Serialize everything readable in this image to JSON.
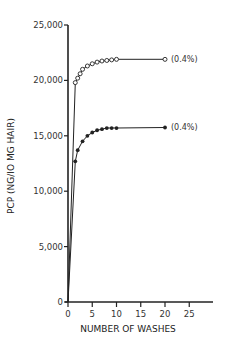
{
  "chart_data": {
    "type": "line",
    "title": "",
    "xlabel": "NUMBER OF WASHES",
    "ylabel": "PCP (NG/IO MG HAIR)",
    "xlim": [
      0,
      25
    ],
    "ylim": [
      0,
      25000
    ],
    "x_ticks": [
      0,
      5,
      10,
      15,
      20,
      25
    ],
    "y_ticks": [
      0,
      5000,
      10000,
      15000,
      20000,
      25000
    ],
    "x_tick_labels": [
      "0",
      "5",
      "10",
      "15",
      "20",
      "25"
    ],
    "y_tick_labels": [
      "0",
      "5,000",
      "10,000",
      "15,000",
      "20,000",
      "25,000"
    ],
    "grid": false,
    "legend": null,
    "series": [
      {
        "name": "open circles",
        "marker": "open-circle",
        "annotation": "(0.4%)",
        "x": [
          0,
          1.5,
          2,
          2.5,
          3,
          4,
          5,
          6,
          7,
          8,
          9,
          10,
          20
        ],
        "values": [
          0,
          19800,
          20200,
          20600,
          21000,
          21300,
          21500,
          21650,
          21750,
          21800,
          21850,
          21900,
          21900
        ]
      },
      {
        "name": "filled circles",
        "marker": "filled-circle",
        "annotation": "(0.4%)",
        "x": [
          0,
          1.5,
          2,
          3,
          4,
          5,
          6,
          7,
          8,
          9,
          10,
          20
        ],
        "values": [
          0,
          12700,
          13700,
          14500,
          15000,
          15300,
          15500,
          15600,
          15700,
          15700,
          15700,
          15750
        ]
      }
    ]
  }
}
